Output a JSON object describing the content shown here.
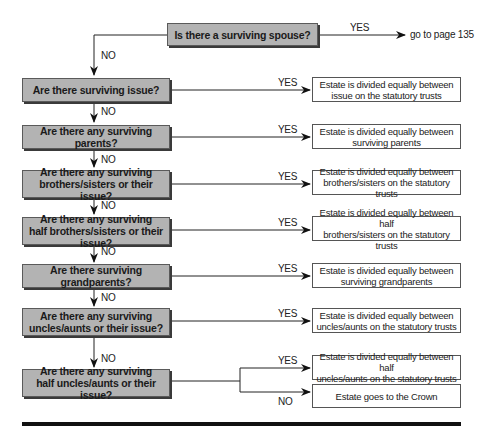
{
  "diagram": {
    "start": {
      "question": "Is there a surviving spouse?",
      "yes_label": "YES",
      "yes_target": "go to page 135",
      "no_label": "NO"
    },
    "steps": [
      {
        "question": "Are there surviving issue?",
        "yes_label": "YES",
        "result": "Estate is divided equally between\nissue on the statutory trusts",
        "no_label": "NO"
      },
      {
        "question": "Are there any surviving parents?",
        "yes_label": "YES",
        "result": "Estate is divided equally between\nsurviving parents",
        "no_label": "NO"
      },
      {
        "question": "Are there any surviving\nbrothers/sisters or their issue?",
        "yes_label": "YES",
        "result": "Estate is divided equally between\nbrothers/sisters on the statutory trusts",
        "no_label": "NO"
      },
      {
        "question": "Are there any surviving\nhalf brothers/sisters or their issue?",
        "yes_label": "YES",
        "result": "Estate is divided equally between half\nbrothers/sisters on the statutory trusts",
        "no_label": "NO"
      },
      {
        "question": "Are there surviving grandparents?",
        "yes_label": "YES",
        "result": "Estate is divided equally between\nsurviving grandparents",
        "no_label": "NO"
      },
      {
        "question": "Are there any surviving\nuncles/aunts or their issue?",
        "yes_label": "YES",
        "result": "Estate is divided equally between\nuncles/aunts on the statutory trusts",
        "no_label": "NO"
      },
      {
        "question": "Are there any surviving\nhalf uncles/aunts or their issue?",
        "yes_label": "YES",
        "result": "Estate is divided equally between half\nuncles/aunts on the statutory trusts",
        "no_label": "NO",
        "no_result": "Estate goes to the Crown"
      }
    ]
  },
  "colors": {
    "decision_fill": "#b3b3b3",
    "decision_border": "#5a5a5a",
    "result_fill": "#ffffff",
    "line": "#222222"
  }
}
